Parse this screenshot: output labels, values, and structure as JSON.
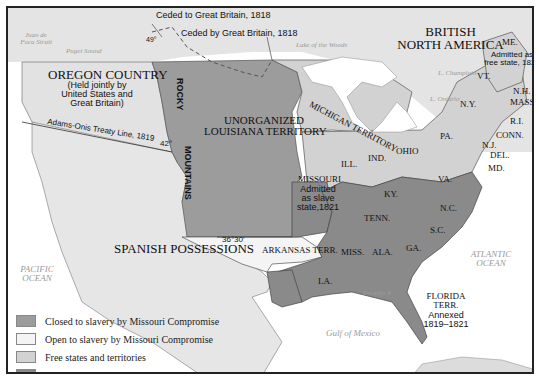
{
  "map": {
    "title_regions": {
      "british_north_america": [
        "BRITISH",
        "NORTH AMERICA"
      ],
      "oregon_country": "OREGON COUNTRY",
      "oregon_note": [
        "(Held jointly by",
        "United States and",
        "Great Britain)"
      ],
      "unorganized": [
        "UNORGANIZED",
        "LOUISIANA TERRITORY"
      ],
      "michigan": "MICHIGAN TERRITORY",
      "spanish": "SPANISH POSSESSIONS",
      "arkansas": "ARKANSAS TERR.",
      "missouri": "MISSOURI",
      "missouri_note": [
        "Admitted",
        "as slave",
        "state,1821"
      ],
      "maine": "ME.",
      "maine_note": [
        "Admitted as",
        "free state, 1820"
      ],
      "florida": [
        "FLORIDA",
        "TERR."
      ],
      "florida_note": [
        "Annexed",
        "1819–1821"
      ],
      "rocky": "ROCKY",
      "mountains": "MOUNTAINS"
    },
    "states": {
      "vt": "VT.",
      "nh": "N.H.",
      "mass": "MASS.",
      "ny": "N.Y.",
      "ri": "R.I.",
      "conn": "CONN.",
      "pa": "PA.",
      "nj": "N.J.",
      "del": "DEL.",
      "md": "MD.",
      "ohio": "OHIO",
      "ind": "IND.",
      "ill": "ILL.",
      "va": "VA.",
      "ky": "KY.",
      "nc": "N.C.",
      "tenn": "TENN.",
      "sc": "S.C.",
      "ga": "GA.",
      "ala": "ALA.",
      "miss": "MISS.",
      "la": "LA."
    },
    "annotations": {
      "ceded_to": "Ceded to Great Britain, 1818",
      "ceded_by": "Ceded by Great Britain, 1818",
      "adams_onis": "Adams-Onis Treaty Line, 1819",
      "lat49": "49°",
      "lat42": "42°",
      "lat3630": "36°30'"
    },
    "water": {
      "juan_de_fuca": [
        "Juan de",
        "Fuca Strait"
      ],
      "puget": "Puget Sound",
      "lake_woods": "Lake of the Woods",
      "superior": "L. Superior",
      "champlain": "L. Champlain",
      "ontario": "L. Ontario",
      "pacific": [
        "PACIFIC",
        "OCEAN"
      ],
      "atlantic": [
        "ATLANTIC",
        "OCEAN"
      ],
      "gulf": "Gulf of Mexico",
      "perdido": "Perdido R."
    },
    "colors": {
      "closed": "#9c9c9c",
      "open": "#f2f2f2",
      "free": "#d2d2d2",
      "slave": "#8a8a8a",
      "land_other": "#e4e4e4",
      "water": "#ffffff"
    }
  },
  "legend": {
    "items": [
      {
        "label": "Closed to slavery by Missouri Compromise",
        "color": "#9c9c9c"
      },
      {
        "label": "Open to slavery by Missouri Compromise",
        "color": "#f2f2f2"
      },
      {
        "label": "Free states and territories",
        "color": "#d2d2d2"
      },
      {
        "label": "Slave states and territories",
        "color": "#8a8a8a"
      }
    ]
  }
}
